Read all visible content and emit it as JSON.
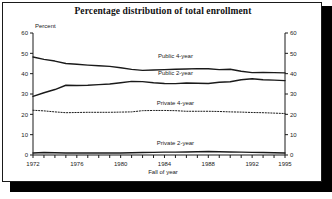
{
  "figure": {
    "title": "Percentage distribution of total enrollment",
    "y_axis_caption": "Percent",
    "x_axis_caption": "Fall of year"
  },
  "chart_data": {
    "type": "line",
    "title": "Percentage distribution of total enrollment",
    "xlabel": "Fall of year",
    "ylabel": "Percent",
    "xlim": [
      1972,
      1995
    ],
    "ylim": [
      0,
      60
    ],
    "grid": false,
    "legend_position": "inline-labels",
    "dual_y_axis": true,
    "y_ticks": [
      0,
      10,
      20,
      30,
      40,
      50,
      60
    ],
    "y_tick_labels": [
      "0",
      "10",
      "20",
      "30",
      "40",
      "50",
      "60"
    ],
    "x_ticks": [
      1972,
      1973,
      1974,
      1975,
      1976,
      1977,
      1978,
      1979,
      1980,
      1981,
      1982,
      1983,
      1984,
      1985,
      1986,
      1987,
      1988,
      1989,
      1990,
      1991,
      1992,
      1993,
      1994,
      1995
    ],
    "x_tick_labels_shown": [
      "1972",
      "1976",
      "1980",
      "1984",
      "1988",
      "1992",
      "1995"
    ],
    "x": [
      1972,
      1973,
      1974,
      1975,
      1976,
      1977,
      1978,
      1979,
      1980,
      1981,
      1982,
      1983,
      1984,
      1985,
      1986,
      1987,
      1988,
      1989,
      1990,
      1991,
      1992,
      1993,
      1994,
      1995
    ],
    "series": [
      {
        "name": "Public 4-year",
        "style": "solid",
        "color": "#1a1a1a",
        "label_x": 1985,
        "label_y": 47.5,
        "values": [
          48.2,
          47.0,
          46.2,
          45.0,
          44.6,
          44.2,
          43.9,
          43.6,
          42.9,
          42.1,
          41.6,
          41.8,
          42.0,
          42.2,
          42.3,
          42.5,
          42.4,
          42.0,
          42.2,
          41.2,
          40.5,
          40.6,
          40.5,
          40.4
        ]
      },
      {
        "name": "Public 2-year",
        "style": "solid",
        "color": "#1a1a1a",
        "label_x": 1985,
        "label_y": 39.5,
        "values": [
          28.8,
          30.6,
          32.2,
          34.3,
          34.2,
          34.3,
          34.6,
          34.9,
          35.5,
          36.2,
          36.1,
          35.5,
          35.2,
          35.1,
          35.4,
          35.3,
          35.2,
          35.8,
          36.0,
          37.0,
          37.5,
          37.0,
          36.8,
          36.6
        ]
      },
      {
        "name": "Private 4-year",
        "style": "dotted",
        "color": "#1a1a1a",
        "label_x": 1985,
        "label_y": 24.5,
        "values": [
          22.0,
          21.7,
          21.2,
          20.8,
          20.9,
          21.0,
          21.0,
          21.0,
          21.1,
          21.2,
          21.8,
          21.9,
          21.9,
          21.8,
          21.5,
          21.5,
          21.5,
          21.4,
          21.2,
          21.1,
          20.9,
          20.8,
          20.6,
          20.4
        ]
      },
      {
        "name": "Private 2-year",
        "style": "solid",
        "color": "#1a1a1a",
        "label_x": 1985,
        "label_y": 5.0,
        "values": [
          1.0,
          1.2,
          1.1,
          1.0,
          1.0,
          1.0,
          1.0,
          1.0,
          1.0,
          1.1,
          1.2,
          1.3,
          1.4,
          1.4,
          1.5,
          1.6,
          1.7,
          1.6,
          1.5,
          1.4,
          1.3,
          1.2,
          1.1,
          1.0
        ]
      }
    ]
  }
}
